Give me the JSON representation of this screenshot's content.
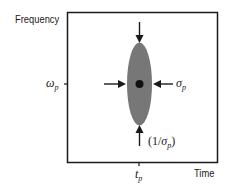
{
  "diagram": {
    "y_axis_label": "Frequency",
    "x_axis_label": "Time",
    "y_tick_label": {
      "base": "ω",
      "sub": "p"
    },
    "x_tick_label": {
      "base": "t",
      "sub": "p"
    },
    "width_label": {
      "base": "σ",
      "sub": "p"
    },
    "height_label": {
      "prefix": "(1/",
      "base": "σ",
      "sub": "p",
      "suffix": ")"
    },
    "colors": {
      "ellipse_fill": "#777777",
      "line": "#1a1a1a",
      "background": "#ffffff"
    }
  }
}
